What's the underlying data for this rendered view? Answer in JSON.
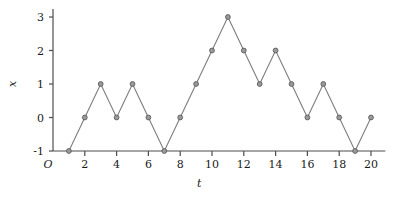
{
  "chart_data": {
    "type": "line",
    "title": "",
    "subtitle": "",
    "xlabel": "t",
    "ylabel": "x",
    "x": [
      1,
      2,
      3,
      4,
      5,
      6,
      7,
      8,
      9,
      10,
      11,
      12,
      13,
      14,
      15,
      16,
      17,
      18,
      19,
      20
    ],
    "values": [
      -1,
      0,
      1,
      0,
      1,
      0,
      -1,
      0,
      1,
      2,
      3,
      2,
      1,
      2,
      1,
      0,
      1,
      0,
      -1,
      0
    ],
    "series": [
      {
        "name": "x",
        "values": [
          -1,
          0,
          1,
          0,
          1,
          0,
          -1,
          0,
          1,
          2,
          3,
          2,
          1,
          2,
          1,
          0,
          1,
          0,
          -1,
          0
        ]
      }
    ],
    "xlim": [
      0,
      20.8
    ],
    "ylim": [
      -1,
      3
    ],
    "xticks": [
      2,
      4,
      6,
      8,
      10,
      12,
      14,
      16,
      18,
      20
    ],
    "xtick_labels": [
      "2",
      "4",
      "6",
      "8",
      "10",
      "12",
      "14",
      "16",
      "18",
      "20"
    ],
    "yticks": [
      -1,
      0,
      1,
      2,
      3
    ],
    "ytick_labels": [
      "-1",
      "0",
      "1",
      "2",
      "3"
    ],
    "origin_label": "O",
    "grid": false,
    "legend": false,
    "legend_position": "none",
    "marker": "circle",
    "line_color": "#7d7d7d",
    "marker_fill": "#9a9a9a",
    "marker_stroke": "#5a5a5a",
    "axis_color": "#4d4d4d",
    "background": "#ffffff"
  }
}
